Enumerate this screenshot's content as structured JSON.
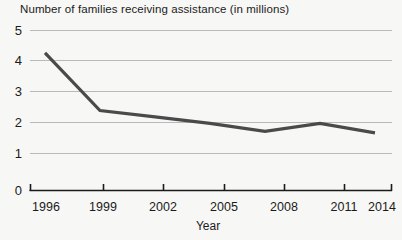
{
  "chart_data": {
    "type": "line",
    "title": "Number of families receiving assistance (in millions)",
    "xlabel": "Year",
    "ylabel": "",
    "x": [
      1996,
      1999,
      2002,
      2005,
      2008,
      2011,
      2014
    ],
    "categories": [
      "1996",
      "1999",
      "2002",
      "2005",
      "2008",
      "2011",
      "2014"
    ],
    "values": [
      4.3,
      2.5,
      2.3,
      2.1,
      1.85,
      2.1,
      1.8
    ],
    "series": [
      {
        "name": "Families receiving assistance",
        "values": [
          4.3,
          2.5,
          2.3,
          2.1,
          1.85,
          2.1,
          1.8
        ]
      }
    ],
    "xlim": [
      1996,
      2014
    ],
    "ylim": [
      0,
      5
    ],
    "yticks": [
      0,
      1,
      2,
      3,
      4,
      5
    ],
    "ytick_labels": [
      "0",
      "1",
      "2",
      "3",
      "4",
      "5"
    ],
    "xticks": [
      1996,
      1999,
      2002,
      2005,
      2008,
      2011,
      2014
    ],
    "xtick_labels": [
      "1996",
      "1999",
      "2002",
      "2005",
      "2008",
      "2011",
      "2014"
    ],
    "grid": "horizontal",
    "legend": "none",
    "line_color": "#4a4a4a",
    "grid_color": "#b9b9b9",
    "axis_color": "#1b1b1b",
    "background_color": "#f7f7f5"
  },
  "title": "Number of families receiving assistance (in millions)",
  "axis": {
    "x_label": "Year",
    "y_labels": [
      "5",
      "4",
      "3",
      "2",
      "1",
      "0"
    ],
    "x_labels": [
      "1996",
      "1999",
      "2002",
      "2005",
      "2008",
      "2011",
      "2014"
    ]
  }
}
